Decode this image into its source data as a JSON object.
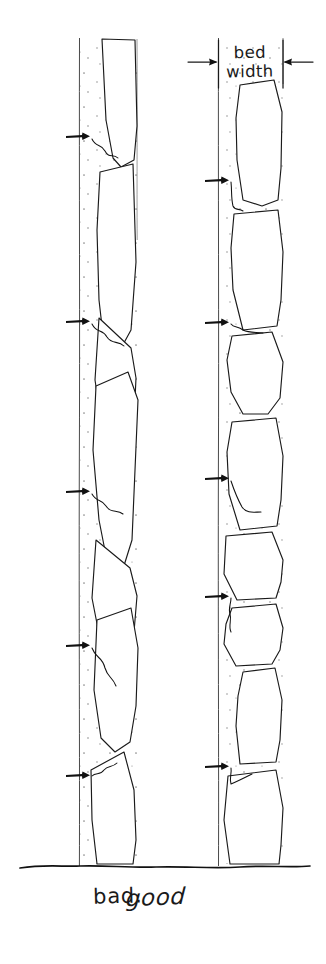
{
  "figure": {
    "title_alt": "Drystone wall bed orientation comparison sketch",
    "background_color": "#ffffff",
    "ink_color": "#1a1a1a",
    "guideline_color": "#4a4a4a",
    "mortar_dot_color": "#8a8a8a"
  },
  "annotations": {
    "bed_width_label_line1": "bed",
    "bed_width_label_line2": "width",
    "left_caption": "bad.",
    "right_caption": "good"
  },
  "columns": {
    "left": {
      "caption": "bad.",
      "caption_x": 118,
      "caption_y": 903,
      "face_line_x": 79,
      "back_line_x": 137,
      "top_y": 38,
      "bottom_y": 866,
      "bed_note": "sloping wedge-shaped beds",
      "pointer_arrow_ys": [
        136,
        321,
        491,
        645,
        775
      ]
    },
    "right": {
      "caption": "good",
      "caption_x": 250,
      "caption_y": 900,
      "face_line_x": 218,
      "back_line_x": 283,
      "top_y": 38,
      "bottom_y": 866,
      "bed_note": "flat level beds",
      "pointer_arrow_ys": [
        180,
        322,
        478,
        596,
        766
      ]
    }
  },
  "dimension": {
    "y": 62,
    "left_tick_x": 218,
    "right_tick_x": 283,
    "left_arrow_from_x": 188,
    "right_arrow_from_x": 313,
    "label_x": 250,
    "label_y_line1": 57,
    "label_y_line2": 76
  },
  "ground_line": {
    "y": 866,
    "x_start": 20,
    "x_end": 310
  }
}
